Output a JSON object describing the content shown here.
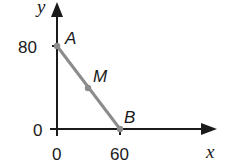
{
  "diagram": {
    "type": "coordinate-plane-segment",
    "axes": {
      "x_label": "x",
      "y_label": "y",
      "origin_x_tick": "0",
      "origin_y_tick": "0",
      "x_tick": "60",
      "y_tick": "80"
    },
    "points": [
      {
        "id": "A",
        "label": "A",
        "coords": [
          0,
          80
        ]
      },
      {
        "id": "M",
        "label": "M",
        "coords": [
          30,
          40
        ],
        "note": "midpoint of AB"
      },
      {
        "id": "B",
        "label": "B",
        "coords": [
          60,
          0
        ]
      }
    ],
    "segment": {
      "from": "A",
      "to": "B"
    },
    "colors": {
      "axis": "#1a1a1a",
      "segment": "#8c8c8c",
      "point": "#8c8c8c",
      "text": "#1a1a1a",
      "background": "#ffffff"
    }
  }
}
